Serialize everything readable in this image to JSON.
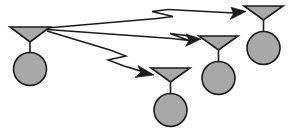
{
  "diagram": {
    "type": "schematic",
    "canvas": {
      "width": 291,
      "height": 139,
      "background": "#ffffff"
    },
    "style": {
      "shape_fill": "#a8a8a8",
      "shape_stroke": "#1a1a1a",
      "line_color": "#1a1a1a",
      "stroke_width": 1.6
    },
    "nodes": [
      {
        "id": "node-transmitter",
        "role": "transmitter",
        "label": "",
        "dish": {
          "left": 10,
          "right": 50,
          "top": 27,
          "bottom": 42,
          "apex_x": 30,
          "apex_y": 42
        },
        "stem": {
          "x": 30,
          "y1": 42,
          "y2": 53
        },
        "body": {
          "cx": 30,
          "cy": 69,
          "r": 16.5
        }
      },
      {
        "id": "node-receiver-top-right",
        "role": "receiver",
        "label": "",
        "dish": {
          "left": 244,
          "right": 283,
          "top": 6,
          "bottom": 20,
          "apex_x": 263.5,
          "apex_y": 20
        },
        "stem": {
          "x": 263.5,
          "y1": 20,
          "y2": 32
        },
        "body": {
          "cx": 263.5,
          "cy": 48,
          "r": 16.5
        }
      },
      {
        "id": "node-receiver-middle-right",
        "role": "receiver",
        "label": "",
        "dish": {
          "left": 199,
          "right": 238,
          "top": 36,
          "bottom": 50,
          "apex_x": 218.5,
          "apex_y": 50
        },
        "stem": {
          "x": 218.5,
          "y1": 50,
          "y2": 62
        },
        "body": {
          "cx": 218.5,
          "cy": 78,
          "r": 16.5
        }
      },
      {
        "id": "node-receiver-bottom-center",
        "role": "receiver",
        "label": "",
        "dish": {
          "left": 151,
          "right": 190,
          "top": 68,
          "bottom": 82,
          "apex_x": 170.5,
          "apex_y": 82
        },
        "stem": {
          "x": 170.5,
          "y1": 82,
          "y2": 94
        },
        "body": {
          "cx": 170.5,
          "cy": 110,
          "r": 16.5
        }
      }
    ],
    "rays": [
      {
        "id": "ray-to-top-right",
        "from": "node-transmitter",
        "to": "node-receiver-top-right",
        "start": {
          "x": 47,
          "y": 28
        },
        "end": {
          "x": 245,
          "y": 11
        },
        "break_marker": true,
        "break_at": {
          "x": 162,
          "y": 15
        }
      },
      {
        "id": "ray-to-middle-right",
        "from": "node-transmitter",
        "to": "node-receiver-middle-right",
        "start": {
          "x": 47,
          "y": 30
        },
        "end": {
          "x": 200,
          "y": 41
        },
        "break_marker": true,
        "break_at": {
          "x": 183,
          "y": 39
        }
      },
      {
        "id": "ray-to-bottom-center",
        "from": "node-transmitter",
        "to": "node-receiver-bottom-center",
        "start": {
          "x": 47,
          "y": 31
        },
        "end": {
          "x": 153,
          "y": 73
        },
        "break_marker": true,
        "break_at": {
          "x": 120,
          "y": 58
        }
      }
    ]
  }
}
